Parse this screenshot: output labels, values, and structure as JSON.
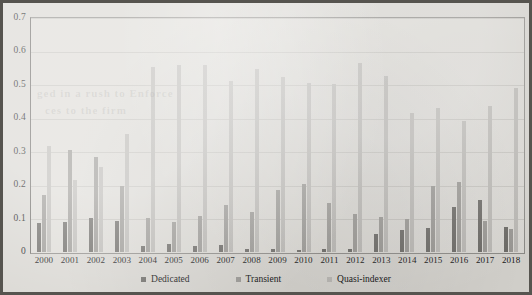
{
  "figure": {
    "background_color": "#d8d6d1",
    "frame_color": "#56544f",
    "plot_background": "#dddbd6"
  },
  "ghost_text": {
    "line1": "ged in a rush to Enforce",
    "line2": "ces to the firm"
  },
  "colors": {
    "dedicated": "#6c6a66",
    "transient": "#9b9995",
    "quasi_indexer": "#bcbab6",
    "gridline": "#c7c5c0",
    "axis": "#6f6d69",
    "text": "#141414"
  },
  "chart_data": {
    "type": "bar",
    "title": "",
    "subtitle": "",
    "xlabel": "",
    "ylabel": "",
    "ylim": [
      0,
      0.7
    ],
    "ytick_values": [
      0,
      0.1,
      0.2,
      0.3,
      0.4,
      0.5,
      0.6,
      0.7
    ],
    "ytick_labels": [
      "0",
      "0.1",
      "0.2",
      "0.3",
      "0.4",
      "0.5",
      "0.6",
      "0.7"
    ],
    "grid": true,
    "grid_axis": "y",
    "legend_position": "bottom",
    "categories": [
      "2000",
      "2001",
      "2002",
      "2003",
      "2004",
      "2005",
      "2006",
      "2007",
      "2008",
      "2009",
      "2010",
      "2011",
      "2012",
      "2013",
      "2014",
      "2015",
      "2016",
      "2017",
      "2018"
    ],
    "series": [
      {
        "name": "Dedicated",
        "color": "#6c6a66",
        "values": [
          0.088,
          0.09,
          0.103,
          0.094,
          0.018,
          0.025,
          0.019,
          0.021,
          0.008,
          0.008,
          0.006,
          0.008,
          0.01,
          0.055,
          0.065,
          0.073,
          0.135,
          0.155,
          0.075
        ]
      },
      {
        "name": "Transient",
        "color": "#9b9995",
        "values": [
          0.17,
          0.305,
          0.285,
          0.196,
          0.102,
          0.09,
          0.108,
          0.14,
          0.12,
          0.185,
          0.203,
          0.148,
          0.113,
          0.105,
          0.1,
          0.196,
          0.21,
          0.093,
          0.068
        ]
      },
      {
        "name": "Quasi-indexer",
        "color": "#bcbab6",
        "values": [
          0.318,
          0.215,
          0.254,
          0.352,
          0.553,
          0.56,
          0.558,
          0.513,
          0.548,
          0.525,
          0.505,
          0.503,
          0.565,
          0.527,
          0.415,
          0.43,
          0.393,
          0.438,
          0.49
        ]
      }
    ]
  },
  "legend": {
    "items": [
      {
        "label": "Dedicated",
        "color": "#6c6a66"
      },
      {
        "label": "Transient",
        "color": "#9b9995"
      },
      {
        "label": "Quasi-indexer",
        "color": "#bcbab6"
      }
    ]
  }
}
